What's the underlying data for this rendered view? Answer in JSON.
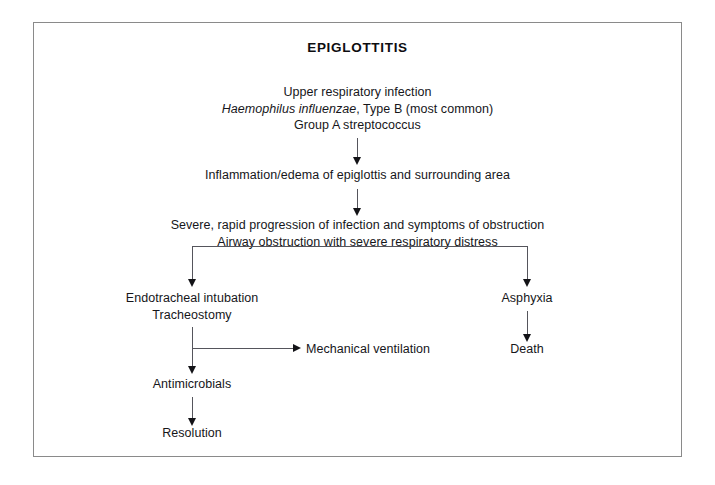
{
  "diagram": {
    "title": "EPIGLOTTITIS",
    "nodes": {
      "cause": {
        "line1": "Upper respiratory infection",
        "line2_italic": "Haemophilus influenzae",
        "line2_rest": ", Type B (most common)",
        "line3": "Group A streptococcus"
      },
      "inflammation": {
        "line1": "Inflammation/edema of epiglottis and surrounding area"
      },
      "progression": {
        "line1": "Severe, rapid progression of infection and symptoms of obstruction",
        "line2": "Airway obstruction with severe respiratory distress"
      },
      "intubation": {
        "line1": "Endotracheal intubation",
        "line2": "Tracheostomy"
      },
      "asphyxia": {
        "line1": "Asphyxia"
      },
      "death": {
        "line1": "Death"
      },
      "ventilation": {
        "line1": "Mechanical ventilation"
      },
      "antimicrobials": {
        "line1": "Antimicrobials"
      },
      "resolution": {
        "line1": "Resolution"
      }
    },
    "colors": {
      "text": "#16161a",
      "connector": "#55555c",
      "arrowhead": "#131317",
      "frame": "#8a8a8a",
      "background": "#ffffff"
    }
  }
}
